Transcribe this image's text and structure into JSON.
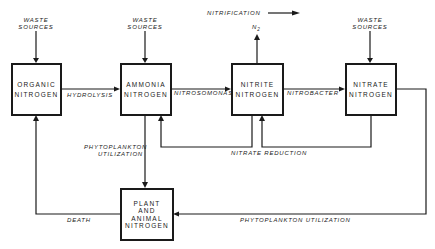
{
  "title_arrow_label": "NITRIFICATION",
  "nodes": {
    "organic": {
      "line1": "ORGANIC",
      "line2": "NITROGEN"
    },
    "ammonia": {
      "line1": "AMMONIA",
      "line2": "NITROGEN"
    },
    "nitrite": {
      "line1": "NITRITE",
      "line2": "NITROGEN"
    },
    "nitrate": {
      "line1": "NITRATE",
      "line2": "NITROGEN"
    },
    "plant": {
      "line1": "PLANT",
      "line2": "AND",
      "line3": "ANIMAL",
      "line4": "NITROGEN"
    }
  },
  "inputs": {
    "waste_line1": "WASTE",
    "waste_line2": "SOURCES",
    "n2_label": "N",
    "n2_sub": "2"
  },
  "edges": {
    "hydrolysis": "HYDROLYSIS",
    "nitrosomonas": "NITROSOMONAS",
    "nitrobacter": "NITROBACTER",
    "phyto_util_line1": "PHYTOPLANKTON",
    "phyto_util_line2": "UTILIZATION",
    "nitrate_reduction": "NITRATE REDUCTION",
    "death": "DEATH",
    "phyto_util_long": "PHYTOPLANKTON UTILIZATION"
  }
}
